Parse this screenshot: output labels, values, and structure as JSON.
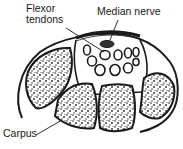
{
  "diagram": {
    "labels": {
      "flexor_line1": "Flexor",
      "flexor_line2": "tendons",
      "median_nerve": "Median nerve",
      "carpus": "Carpus"
    },
    "colors": {
      "stroke": "#1a1a1a",
      "background": "#ffffff"
    }
  }
}
